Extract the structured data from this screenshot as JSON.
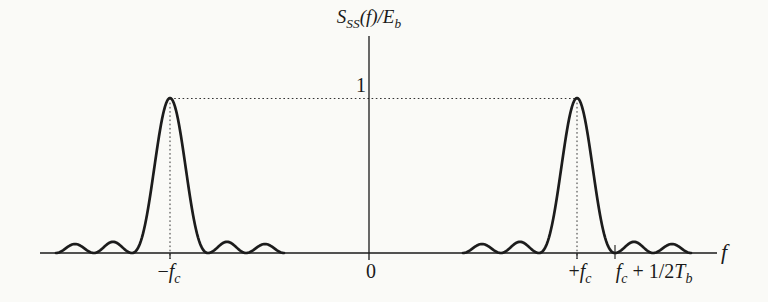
{
  "figure": {
    "background": "#fafaf7",
    "ink": "#1a1a1a",
    "title": {
      "S": "S",
      "S_sub": "SS",
      "mid": "(f)/E",
      "E_sub": "b"
    },
    "y_ref_label": "1",
    "origin_label": "0",
    "x_axis_label": "f",
    "neg_fc": {
      "sign": "−",
      "base": "f",
      "sub": "c"
    },
    "pos_fc": {
      "sign": "+",
      "base": "f",
      "sub": "c"
    },
    "first_null": {
      "base1": "f",
      "sub1": "c",
      "mid": " + 1/2",
      "base2": "T",
      "sub2": "b"
    }
  },
  "chart_data": {
    "type": "line",
    "xlabel": "f",
    "ylabel": "S_SS(f)/E_b (normalized power spectral density)",
    "x_tick_labels": [
      "-f_c",
      "0",
      "+f_c",
      "f_c + 1/2T_b"
    ],
    "y_reference_level": 1,
    "grid": false,
    "legend": "none",
    "series": [
      {
        "name": "normalized PSD",
        "peaks": [
          {
            "x": "-f_c",
            "y": 1
          },
          {
            "x": "+f_c",
            "y": 1
          }
        ],
        "first_null_offset_from_carrier": "1/2T_b",
        "sidelobe_relative_heights": [
          0.072,
          0.058
        ]
      }
    ],
    "curve_model": {
      "centers_px": [
        170,
        577
      ],
      "null_spacing_px": 38,
      "baseline_y_px": 253,
      "amplitude_px": 155,
      "sidelobe_heights": [
        0.072,
        0.058
      ]
    }
  }
}
